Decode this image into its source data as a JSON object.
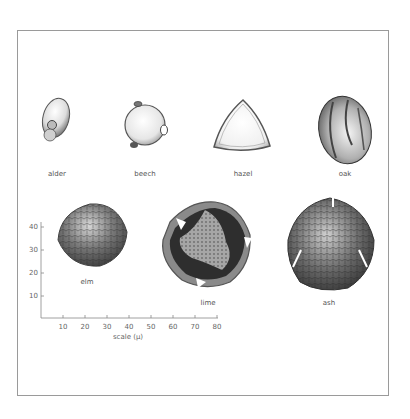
{
  "figure": {
    "grains": [
      {
        "name": "alder",
        "label": "alder"
      },
      {
        "name": "beech",
        "label": "beech"
      },
      {
        "name": "hazel",
        "label": "hazel"
      },
      {
        "name": "oak",
        "label": "oak"
      },
      {
        "name": "elm",
        "label": "elm"
      },
      {
        "name": "lime",
        "label": "lime"
      },
      {
        "name": "ash",
        "label": "ash"
      }
    ],
    "scale": {
      "x_label": "scale (µ)",
      "x_ticks": [
        "10",
        "20",
        "30",
        "40",
        "50",
        "60",
        "70",
        "80"
      ],
      "y_ticks": [
        "40",
        "30",
        "20",
        "10"
      ]
    },
    "colors": {
      "frame": "#9a9a9a",
      "axis": "#888888",
      "label": "#555555"
    }
  }
}
